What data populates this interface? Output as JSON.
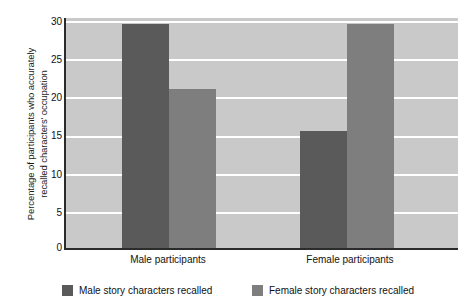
{
  "chart_data": {
    "type": "bar",
    "title": "",
    "xlabel": "",
    "ylabel_line1": "Percentage of participants who accurately",
    "ylabel_line2": "recalled characters' occupation",
    "categories": [
      "Male participants",
      "Female participants"
    ],
    "series": [
      {
        "name": "Male story characters recalled",
        "color": "#5a5a5a",
        "values": [
          29.2,
          15.2
        ]
      },
      {
        "name": "Female story characters recalled",
        "color": "#7e7e7e",
        "values": [
          20.8,
          29.2
        ]
      }
    ],
    "ylim": [
      0,
      30
    ],
    "ytick_labels": [
      "0",
      "5",
      "10",
      "15",
      "20",
      "25",
      "30"
    ],
    "ytick_values": [
      0,
      5,
      10,
      15,
      20,
      25,
      30
    ],
    "grid": true,
    "grid_color": "#ffffff",
    "plot_background": "#c9c9c9",
    "legend_position": "bottom"
  }
}
